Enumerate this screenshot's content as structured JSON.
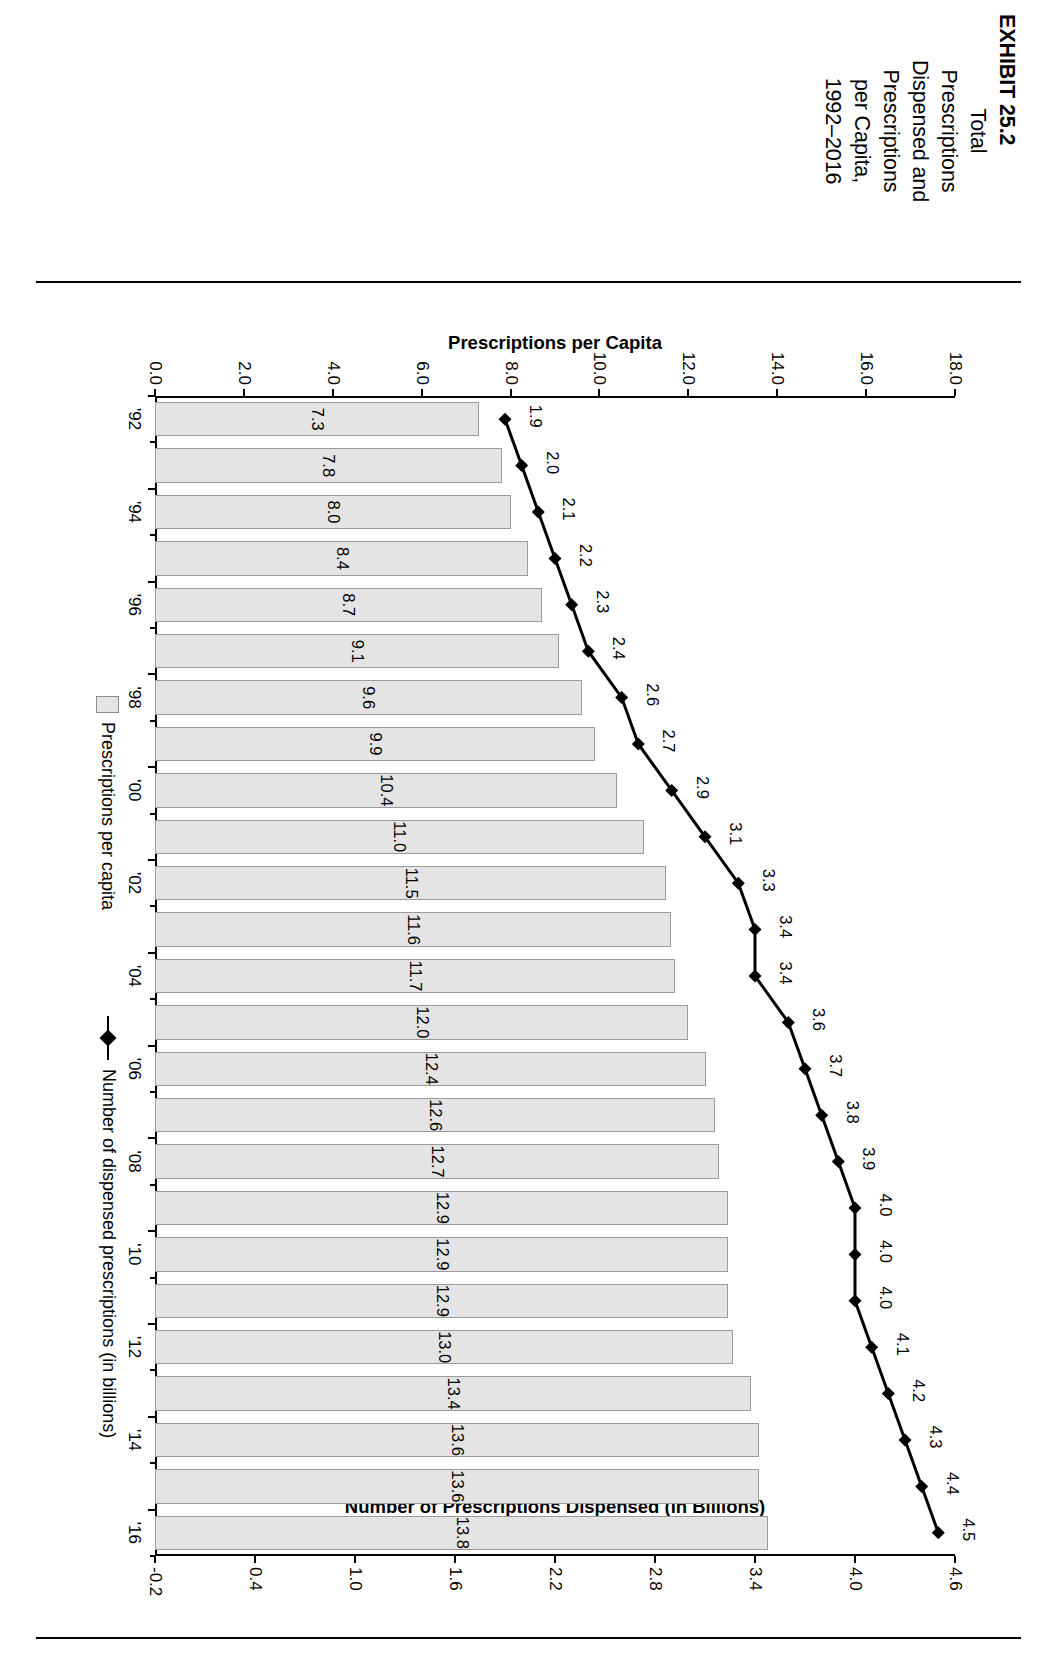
{
  "caption": {
    "exhibit_number": "EXHIBIT 25.2",
    "lines": [
      "EXHIBIT 25.2",
      "Total",
      "Prescriptions",
      "Dispensed and",
      "Prescriptions",
      "per Capita,",
      "1992–2016"
    ],
    "full_title": "EXHIBIT 25.2 Total Prescriptions Dispensed and Prescriptions per Capita, 1992–2016"
  },
  "legend": {
    "position": "bottom",
    "items": [
      {
        "label": "Prescriptions per capita",
        "marker": "bar-swatch",
        "color": "#e4e4e4"
      },
      {
        "label": "Number of dispensed prescriptions (in billions)",
        "marker": "line-diamond",
        "color": "#000000"
      }
    ]
  },
  "chart_data": {
    "type": "bar",
    "title": "EXHIBIT 25.2 Total Prescriptions Dispensed and Prescriptions per Capita, 1992–2016",
    "xlabel": "",
    "ylabel": "Prescriptions per Capita",
    "y2label": "Number of Prescriptions Dispensed (in Billions)",
    "ylim": [
      0.0,
      18.0
    ],
    "y2lim": [
      -0.2,
      4.6
    ],
    "grid": false,
    "x": [
      "'92",
      "'93",
      "'94",
      "'95",
      "'96",
      "'97",
      "'98",
      "'99",
      "'00",
      "'01",
      "'02",
      "'03",
      "'04",
      "'05",
      "'06",
      "'07",
      "'08",
      "'09",
      "'10",
      "'11",
      "'12",
      "'13",
      "'14",
      "'15",
      "'16"
    ],
    "xtick_labels": [
      "'92",
      "",
      "'94",
      "",
      "'96",
      "",
      "'98",
      "",
      "'00",
      "",
      "'02",
      "",
      "'04",
      "",
      "'06",
      "",
      "'08",
      "",
      "'10",
      "",
      "'12",
      "",
      "'14",
      "",
      "'16"
    ],
    "ytick_labels": [
      "0.0",
      "2.0",
      "4.0",
      "6.0",
      "8.0",
      "10.0",
      "12.0",
      "14.0",
      "16.0",
      "18.0"
    ],
    "ytick_values": [
      0.0,
      2.0,
      4.0,
      6.0,
      8.0,
      10.0,
      12.0,
      14.0,
      16.0,
      18.0
    ],
    "y2tick_labels": [
      "-0.2",
      "0.4",
      "1.0",
      "1.6",
      "2.2",
      "2.8",
      "3.4",
      "4.0",
      "4.6"
    ],
    "y2tick_values": [
      -0.2,
      0.4,
      1.0,
      1.6,
      2.2,
      2.8,
      3.4,
      4.0,
      4.6
    ],
    "series": [
      {
        "name": "Prescriptions per capita",
        "kind": "bar",
        "axis": "left",
        "values": [
          7.3,
          7.8,
          8.0,
          8.4,
          8.7,
          9.1,
          9.6,
          9.9,
          10.4,
          11.0,
          11.5,
          11.6,
          11.7,
          12.0,
          12.4,
          12.6,
          12.7,
          12.9,
          12.9,
          12.9,
          13.0,
          13.4,
          13.6,
          13.6,
          13.8
        ],
        "labels": [
          "7.3",
          "7.8",
          "8.0",
          "8.4",
          "8.7",
          "9.1",
          "9.6",
          "9.9",
          "10.4",
          "11.0",
          "11.5",
          "11.6",
          "11.7",
          "12.0",
          "12.4",
          "12.6",
          "12.7",
          "12.9",
          "12.9",
          "12.9",
          "13.0",
          "13.4",
          "13.6",
          "13.6",
          "13.8"
        ]
      },
      {
        "name": "Number of dispensed prescriptions (in billions)",
        "kind": "line",
        "axis": "right",
        "values": [
          1.9,
          2.0,
          2.1,
          2.2,
          2.3,
          2.4,
          2.6,
          2.7,
          2.9,
          3.1,
          3.3,
          3.4,
          3.4,
          3.6,
          3.7,
          3.8,
          3.9,
          4.0,
          4.0,
          4.0,
          4.1,
          4.2,
          4.3,
          4.4,
          4.5
        ],
        "labels": [
          "1.9",
          "2.0",
          "2.1",
          "2.2",
          "2.3",
          "2.4",
          "2.6",
          "2.7",
          "2.9",
          "3.1",
          "3.3",
          "3.4",
          "3.4",
          "3.6",
          "3.7",
          "3.8",
          "3.9",
          "4.0",
          "4.0",
          "4.0",
          "4.1",
          "4.2",
          "4.3",
          "4.4",
          "4.5"
        ]
      }
    ]
  }
}
